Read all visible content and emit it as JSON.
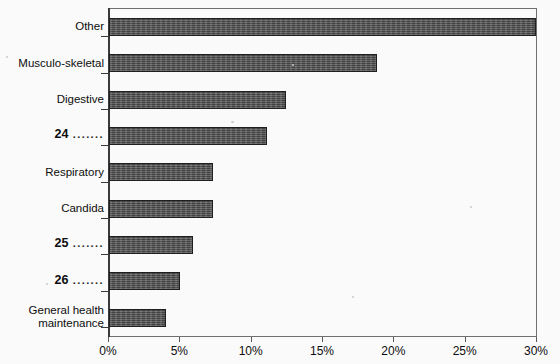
{
  "chart_data": {
    "type": "bar",
    "orientation": "horizontal",
    "title": "",
    "xlabel": "",
    "ylabel": "",
    "xlim": [
      0,
      30
    ],
    "xunit": "%",
    "grid": false,
    "legend": null,
    "xticks": [
      "0%",
      "5%",
      "10%",
      "15%",
      "20%",
      "25%",
      "30%"
    ],
    "xtick_values": [
      0,
      5,
      10,
      15,
      20,
      25,
      30
    ],
    "categories": [
      "Other",
      "Musculo-skeletal",
      "Digestive",
      "24 .......",
      "Respiratory",
      "Candida",
      "25 .......",
      "26 .......",
      "General health maintenance"
    ],
    "values": [
      29.9,
      18.8,
      12.4,
      11.1,
      7.3,
      7.3,
      5.9,
      5.0,
      4.0
    ],
    "bars": [
      {
        "label": "Other",
        "label_line1": "Other",
        "label_line2": "",
        "footnote": "",
        "value": 29.9
      },
      {
        "label": "Musculo-skeletal",
        "label_line1": "Musculo-skeletal",
        "label_line2": "",
        "footnote": "",
        "value": 18.8
      },
      {
        "label": "Digestive",
        "label_line1": "Digestive",
        "label_line2": "",
        "footnote": "",
        "value": 12.4
      },
      {
        "label": "24 .......",
        "label_line1": "24",
        "label_line2": "",
        "footnote": ".......",
        "value": 11.1
      },
      {
        "label": "Respiratory",
        "label_line1": "Respiratory",
        "label_line2": "",
        "footnote": "",
        "value": 7.3
      },
      {
        "label": "Candida",
        "label_line1": "Candida",
        "label_line2": "",
        "footnote": "",
        "value": 7.3
      },
      {
        "label": "25 .......",
        "label_line1": "25",
        "label_line2": "",
        "footnote": ".......",
        "value": 5.9
      },
      {
        "label": "26 .......",
        "label_line1": "26",
        "label_line2": "",
        "footnote": ".......",
        "value": 5.0
      },
      {
        "label": "General health maintenance",
        "label_line1": "General health",
        "label_line2": "maintenance",
        "footnote": "",
        "value": 4.0
      }
    ],
    "colors": {
      "bar_fill": "#4d4d4d",
      "bar_border": "#1f1f1f",
      "axis": "#3a3a3a",
      "frame": "#6f6f6f",
      "text": "#0d0d0d",
      "background": "#fdfdfd"
    }
  }
}
